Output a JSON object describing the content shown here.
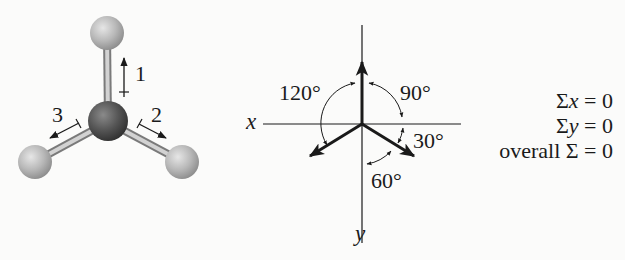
{
  "figure": {
    "molecule": {
      "description": "Trigonal planar molecule, ball-and-stick model",
      "central_atom_color": "#4d4d4d",
      "outer_atom_color": "#b5b5b5",
      "vibration_labels": [
        "1",
        "2",
        "3"
      ]
    },
    "vector_diagram": {
      "axis_x_label": "x",
      "axis_y_label": "y",
      "angles": [
        "120°",
        "90°",
        "30°",
        "60°"
      ]
    },
    "equations": [
      {
        "prefix": "Σ",
        "var": "x",
        "rest": " = 0"
      },
      {
        "prefix": "Σ",
        "var": "y",
        "rest": " = 0"
      },
      {
        "prefix": "overall Σ",
        "var": "",
        "rest": " = 0"
      }
    ]
  }
}
